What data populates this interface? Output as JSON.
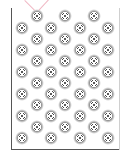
{
  "figure": {
    "colors": {
      "frame": "#555555",
      "pink_line": "#f0b8c4",
      "halo": "#8a8a8a",
      "ring": "#444444",
      "center": "#222222",
      "background": "#ffffff"
    },
    "pink_lines": [
      {
        "x1": 25,
        "y1": 0,
        "x2": 37,
        "y2": 12
      },
      {
        "x1": 49,
        "y1": 0,
        "x2": 38,
        "y2": 12
      }
    ],
    "rows_a": {
      "xs": [
        22,
        51,
        80,
        108
      ],
      "ys": [
        28,
        50,
        72,
        94,
        116,
        138
      ]
    },
    "rows_b": {
      "xs": [
        37,
        65,
        94
      ],
      "ys": [
        16,
        39,
        61,
        83,
        105,
        127
      ]
    },
    "marker_count": 42
  }
}
